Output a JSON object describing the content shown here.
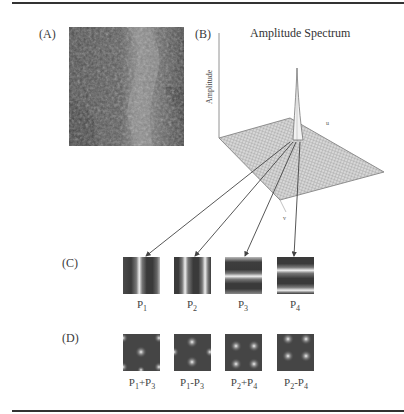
{
  "figure": {
    "panels": {
      "A": {
        "label": "(A)",
        "description": "natural texture photograph"
      },
      "B": {
        "label": "(B)",
        "title": "Amplitude Spectrum",
        "axis_vertical": "Amplitude",
        "axis_u": "u",
        "axis_v": "v"
      },
      "C": {
        "label": "(C)",
        "tiles": [
          {
            "name": "P",
            "sub": "1",
            "orientation": "vertical",
            "stripes": 2
          },
          {
            "name": "P",
            "sub": "2",
            "orientation": "vertical",
            "stripes": 2
          },
          {
            "name": "P",
            "sub": "3",
            "orientation": "horizontal",
            "stripes": 2
          },
          {
            "name": "P",
            "sub": "4",
            "orientation": "horizontal",
            "stripes": 2
          }
        ]
      },
      "D": {
        "label": "(D)",
        "tiles": [
          {
            "name": "P",
            "sub1": "1",
            "op": "+",
            "name2": "P",
            "sub2": "3"
          },
          {
            "name": "P",
            "sub1": "1",
            "op": "-",
            "name2": "P",
            "sub2": "3"
          },
          {
            "name": "P",
            "sub1": "2",
            "op": "+",
            "name2": "P",
            "sub2": "4"
          },
          {
            "name": "P",
            "sub1": "2",
            "op": "-",
            "name2": "P",
            "sub2": "4"
          }
        ]
      }
    },
    "colors": {
      "rule": "#333333",
      "photo_dark": "#4a4a4a",
      "photo_light": "#9a9a9a",
      "tile_dark": "#3c3c3c",
      "tile_light": "#e8e8e8"
    }
  }
}
